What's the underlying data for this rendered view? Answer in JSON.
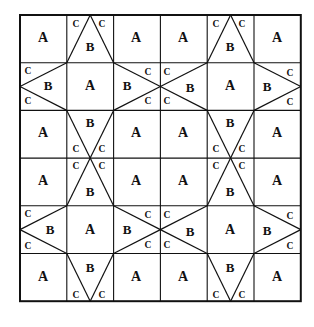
{
  "figure": {
    "grid": {
      "cols": 6,
      "rows": 6,
      "left": 20,
      "top": 15,
      "cell_w": 46.8,
      "cell_h": 47.7
    },
    "colors": {
      "line": "#111111",
      "background": "#ffffff",
      "rule": "#8d8d8d",
      "label": "#111111"
    },
    "piece_legend": [
      {
        "key": "A",
        "label": "A",
        "shape": "square"
      },
      {
        "key": "B",
        "label": "B",
        "shape": "large-triangle"
      },
      {
        "key": "C",
        "label": "C",
        "shape": "small-triangle"
      }
    ],
    "labels": [
      {
        "text": "A",
        "kind": "A",
        "x": 43,
        "y": 39
      },
      {
        "text": "C",
        "kind": "C",
        "x": 76,
        "y": 25
      },
      {
        "text": "C",
        "kind": "C",
        "x": 102,
        "y": 25
      },
      {
        "text": "B",
        "kind": "B",
        "x": 90,
        "y": 48
      },
      {
        "text": "A",
        "kind": "A",
        "x": 136,
        "y": 39
      },
      {
        "text": "A",
        "kind": "A",
        "x": 183,
        "y": 39
      },
      {
        "text": "C",
        "kind": "C",
        "x": 216,
        "y": 25
      },
      {
        "text": "C",
        "kind": "C",
        "x": 242,
        "y": 25
      },
      {
        "text": "B",
        "kind": "B",
        "x": 230,
        "y": 48
      },
      {
        "text": "A",
        "kind": "A",
        "x": 277,
        "y": 39
      },
      {
        "text": "C",
        "kind": "C",
        "x": 28,
        "y": 72
      },
      {
        "text": "B",
        "kind": "B",
        "x": 48,
        "y": 87
      },
      {
        "text": "C",
        "kind": "C",
        "x": 28,
        "y": 102
      },
      {
        "text": "A",
        "kind": "A",
        "x": 90,
        "y": 87
      },
      {
        "text": "B",
        "kind": "B",
        "x": 127,
        "y": 87
      },
      {
        "text": "C",
        "kind": "C",
        "x": 148,
        "y": 73
      },
      {
        "text": "C",
        "kind": "C",
        "x": 167,
        "y": 73
      },
      {
        "text": "C",
        "kind": "C",
        "x": 148,
        "y": 102
      },
      {
        "text": "C",
        "kind": "C",
        "x": 167,
        "y": 102
      },
      {
        "text": "B",
        "kind": "B",
        "x": 190,
        "y": 89
      },
      {
        "text": "A",
        "kind": "A",
        "x": 230,
        "y": 87
      },
      {
        "text": "B",
        "kind": "B",
        "x": 267,
        "y": 88
      },
      {
        "text": "C",
        "kind": "C",
        "x": 290,
        "y": 74
      },
      {
        "text": "C",
        "kind": "C",
        "x": 290,
        "y": 103
      },
      {
        "text": "A",
        "kind": "A",
        "x": 43,
        "y": 134
      },
      {
        "text": "B",
        "kind": "B",
        "x": 90,
        "y": 124
      },
      {
        "text": "C",
        "kind": "C",
        "x": 76,
        "y": 150
      },
      {
        "text": "C",
        "kind": "C",
        "x": 102,
        "y": 150
      },
      {
        "text": "A",
        "kind": "A",
        "x": 136,
        "y": 134
      },
      {
        "text": "A",
        "kind": "A",
        "x": 183,
        "y": 134
      },
      {
        "text": "B",
        "kind": "B",
        "x": 230,
        "y": 124
      },
      {
        "text": "C",
        "kind": "C",
        "x": 216,
        "y": 150
      },
      {
        "text": "C",
        "kind": "C",
        "x": 242,
        "y": 150
      },
      {
        "text": "A",
        "kind": "A",
        "x": 277,
        "y": 134
      },
      {
        "text": "C",
        "kind": "C",
        "x": 76,
        "y": 167
      },
      {
        "text": "C",
        "kind": "C",
        "x": 102,
        "y": 167
      },
      {
        "text": "A",
        "kind": "A",
        "x": 43,
        "y": 182
      },
      {
        "text": "B",
        "kind": "B",
        "x": 90,
        "y": 193
      },
      {
        "text": "A",
        "kind": "A",
        "x": 136,
        "y": 182
      },
      {
        "text": "A",
        "kind": "A",
        "x": 183,
        "y": 182
      },
      {
        "text": "C",
        "kind": "C",
        "x": 216,
        "y": 167
      },
      {
        "text": "C",
        "kind": "C",
        "x": 242,
        "y": 167
      },
      {
        "text": "B",
        "kind": "B",
        "x": 230,
        "y": 193
      },
      {
        "text": "A",
        "kind": "A",
        "x": 277,
        "y": 182
      },
      {
        "text": "C",
        "kind": "C",
        "x": 28,
        "y": 215
      },
      {
        "text": "B",
        "kind": "B",
        "x": 50,
        "y": 231
      },
      {
        "text": "C",
        "kind": "C",
        "x": 28,
        "y": 247
      },
      {
        "text": "A",
        "kind": "A",
        "x": 90,
        "y": 231
      },
      {
        "text": "B",
        "kind": "B",
        "x": 127,
        "y": 231
      },
      {
        "text": "C",
        "kind": "C",
        "x": 148,
        "y": 216
      },
      {
        "text": "C",
        "kind": "C",
        "x": 167,
        "y": 216
      },
      {
        "text": "C",
        "kind": "C",
        "x": 148,
        "y": 246
      },
      {
        "text": "C",
        "kind": "C",
        "x": 167,
        "y": 246
      },
      {
        "text": "B",
        "kind": "B",
        "x": 190,
        "y": 233
      },
      {
        "text": "A",
        "kind": "A",
        "x": 230,
        "y": 231
      },
      {
        "text": "B",
        "kind": "B",
        "x": 267,
        "y": 232
      },
      {
        "text": "C",
        "kind": "C",
        "x": 290,
        "y": 217
      },
      {
        "text": "C",
        "kind": "C",
        "x": 290,
        "y": 247
      },
      {
        "text": "A",
        "kind": "A",
        "x": 43,
        "y": 278
      },
      {
        "text": "B",
        "kind": "B",
        "x": 90,
        "y": 269
      },
      {
        "text": "C",
        "kind": "C",
        "x": 76,
        "y": 296
      },
      {
        "text": "C",
        "kind": "C",
        "x": 102,
        "y": 296
      },
      {
        "text": "A",
        "kind": "A",
        "x": 136,
        "y": 278
      },
      {
        "text": "A",
        "kind": "A",
        "x": 183,
        "y": 278
      },
      {
        "text": "B",
        "kind": "B",
        "x": 230,
        "y": 269
      },
      {
        "text": "C",
        "kind": "C",
        "x": 216,
        "y": 296
      },
      {
        "text": "C",
        "kind": "C",
        "x": 242,
        "y": 296
      },
      {
        "text": "A",
        "kind": "A",
        "x": 277,
        "y": 278
      }
    ]
  }
}
